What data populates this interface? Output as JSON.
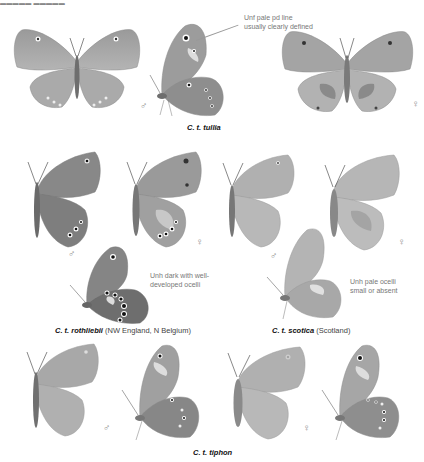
{
  "header": {
    "clipped_text": "▬▬▬▬▬ ▬▬▬▬▬"
  },
  "colors": {
    "wing_dark": "#7a7a7a",
    "wing_mid": "#9c9c9c",
    "wing_light": "#c4c4c4",
    "body": "#6e6e6e",
    "ocellus": "#1a1a1a",
    "text": "#111111",
    "note_text": "#777777"
  },
  "sections": [
    {
      "id": "tullia",
      "caption_species": "C. t. tullia",
      "caption_region": "",
      "note": "Unf pale pd line usually clearly defined",
      "sex_labels": {
        "male": "♂",
        "female": "♀"
      }
    },
    {
      "id": "rothliebii",
      "caption_species": "C. t. rothliebii",
      "caption_region": "(NW England, N Belgium)",
      "note": "Unh dark with well-developed ocelli",
      "sex_labels": {
        "male": "♂",
        "female": "♀"
      }
    },
    {
      "id": "scotica",
      "caption_species": "C. t. scotica",
      "caption_region": "(Scotland)",
      "note": "Unh pale ocelli small or absent",
      "sex_labels": {
        "male": "♂",
        "female": "♀"
      }
    },
    {
      "id": "tiphon",
      "caption_species": "C. t. tiphon",
      "caption_region": "",
      "note": "",
      "sex_labels": {
        "male": "♂",
        "female": "♀"
      }
    }
  ]
}
